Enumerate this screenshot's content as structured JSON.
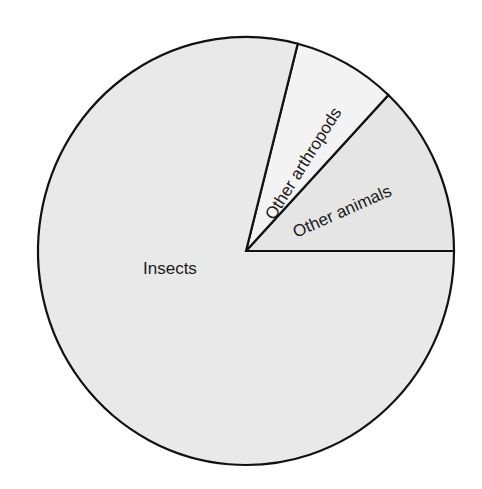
{
  "chart_data": {
    "type": "pie",
    "title": "",
    "categories": [
      "Insects",
      "Other arthropods",
      "Other animals"
    ],
    "values": [
      79,
      8,
      13
    ],
    "unit": "percent (estimated from slice angles)",
    "legend": "none (labels placed inside slices)",
    "start_angle_deg": 0,
    "direction": "counterclockwise from 3 o'clock",
    "colors": [
      "#e9e9e9",
      "#f3f3f3",
      "#e5e5e5"
    ],
    "outline_color": "#111111"
  },
  "labels": {
    "insects": "Insects",
    "other_arthropods": "Other arthropods",
    "other_animals": "Other animals"
  }
}
